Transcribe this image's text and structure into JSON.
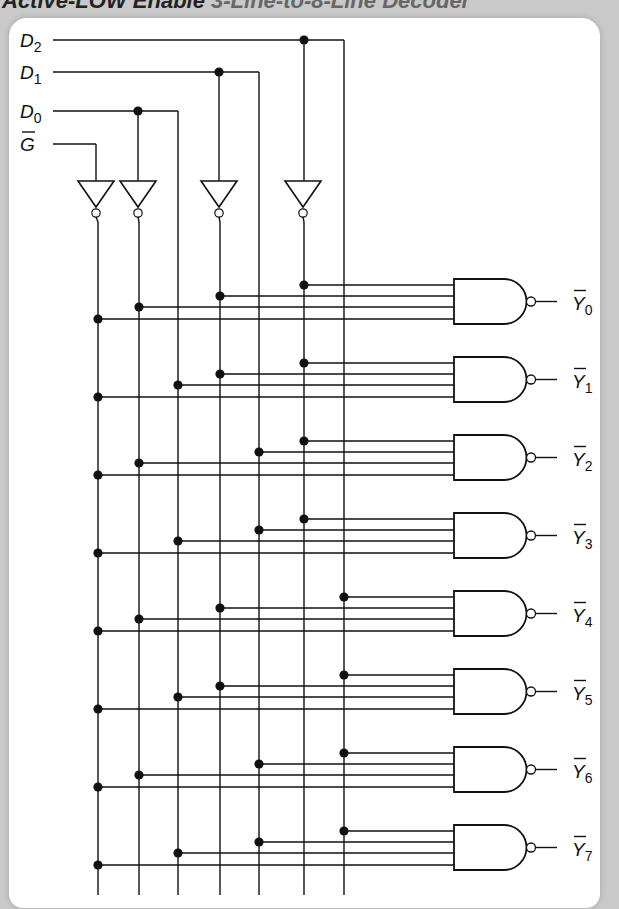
{
  "title": {
    "main": "Active-LOW Enable",
    "rest": "3-Line-to-8-Line Decoder"
  },
  "colors": {
    "background": "#c9c9c9",
    "panel": "#ffffff",
    "ink": "#111111"
  },
  "inputs": [
    {
      "id": "D2",
      "letter": "D",
      "subscript": "2",
      "overbar": false,
      "y": 40
    },
    {
      "id": "D1",
      "letter": "D",
      "subscript": "1",
      "overbar": false,
      "y": 72
    },
    {
      "id": "D0",
      "letter": "D",
      "subscript": "0",
      "overbar": false,
      "y": 111
    },
    {
      "id": "G",
      "letter": "G",
      "subscript": "",
      "overbar": true,
      "y": 144
    }
  ],
  "columns": {
    "G_inv": 98,
    "D0_inv": 139,
    "D0": 178,
    "D1_inv": 220,
    "D1": 259,
    "D2_inv": 304,
    "D2": 344
  },
  "inverters": [
    {
      "name": "G-enable-inverter",
      "x": 96
    },
    {
      "name": "D0-inverter",
      "x": 138
    },
    {
      "name": "D1-inverter",
      "x": 219
    },
    {
      "name": "D2-inverter",
      "x": 303
    }
  ],
  "outputs": [
    {
      "label": "Y",
      "subscript": "0",
      "inputs": [
        "D2_inv",
        "D1_inv",
        "D0_inv",
        "G_inv"
      ]
    },
    {
      "label": "Y",
      "subscript": "1",
      "inputs": [
        "D2_inv",
        "D1_inv",
        "D0",
        "G_inv"
      ]
    },
    {
      "label": "Y",
      "subscript": "2",
      "inputs": [
        "D2_inv",
        "D1",
        "D0_inv",
        "G_inv"
      ]
    },
    {
      "label": "Y",
      "subscript": "3",
      "inputs": [
        "D2_inv",
        "D1",
        "D0",
        "G_inv"
      ]
    },
    {
      "label": "Y",
      "subscript": "4",
      "inputs": [
        "D2",
        "D1_inv",
        "D0_inv",
        "G_inv"
      ]
    },
    {
      "label": "Y",
      "subscript": "5",
      "inputs": [
        "D2",
        "D1_inv",
        "D0",
        "G_inv"
      ]
    },
    {
      "label": "Y",
      "subscript": "6",
      "inputs": [
        "D2",
        "D1",
        "D0_inv",
        "G_inv"
      ]
    },
    {
      "label": "Y",
      "subscript": "7",
      "inputs": [
        "D2",
        "D1",
        "D0",
        "G_inv"
      ]
    }
  ],
  "gate_type": "NAND",
  "output_active": "LOW"
}
